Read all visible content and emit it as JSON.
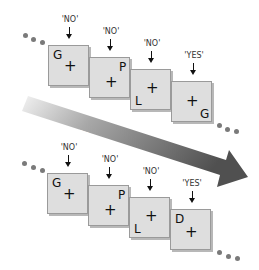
{
  "diagram": {
    "time_arrow": {
      "label": "Time",
      "color_start": "#e8e8e8",
      "color_end": "#555555"
    },
    "rows": [
      {
        "name": "top",
        "frames": [
          {
            "response": "'NO'",
            "letter": "G",
            "letter_pos": "top-left"
          },
          {
            "response": "'NO'",
            "letter": "P",
            "letter_pos": "top-right"
          },
          {
            "response": "'NO'",
            "letter": "L",
            "letter_pos": "bottom-left"
          },
          {
            "response": "'YES'",
            "letter": "G",
            "letter_pos": "bottom-right"
          }
        ]
      },
      {
        "name": "bottom",
        "frames": [
          {
            "response": "'NO'",
            "letter": "G",
            "letter_pos": "top-left"
          },
          {
            "response": "'NO'",
            "letter": "P",
            "letter_pos": "top-right"
          },
          {
            "response": "'NO'",
            "letter": "L",
            "letter_pos": "bottom-left"
          },
          {
            "response": "'YES'",
            "letter": "D",
            "letter_pos": "top-left"
          }
        ]
      }
    ],
    "fixation": "+",
    "ellipsis": "..."
  }
}
